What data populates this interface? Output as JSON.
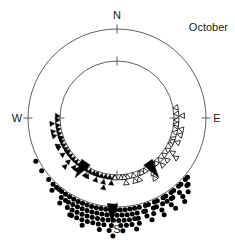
{
  "figure": {
    "title": "October",
    "type": "circular-orientation-diagram"
  },
  "axis_labels": {
    "north": "N",
    "east": "E",
    "south": "S",
    "west": "W"
  },
  "colors": {
    "stroke": "#4d4d4d",
    "marker_fill": "#000000",
    "marker_open_fill": "#ffffff",
    "text": "#1a1a1a",
    "background": "#ffffff"
  },
  "chart_data": {
    "type": "scatter",
    "title": "October",
    "xlabel": "",
    "ylabel": "",
    "coordinate_system": "polar-circular",
    "grid": false,
    "legend": "none",
    "axis_ticks": [
      {
        "label": "N",
        "angle_deg": 0
      },
      {
        "label": "E",
        "angle_deg": 90
      },
      {
        "label": "S",
        "angle_deg": 180
      },
      {
        "label": "W",
        "angle_deg": 270
      }
    ],
    "circles": [
      {
        "name": "outer-circle",
        "radius_px": 89
      },
      {
        "name": "inner-circle",
        "radius_px": 57
      }
    ],
    "center_px": {
      "x": 117,
      "y": 118
    },
    "series": [
      {
        "name": "outer-group-filled-circles",
        "marker": "filled-circle",
        "ring": "outer",
        "mean_vector_deg": 183,
        "values_deg": [
          242,
          235,
          228,
          224,
          221,
          219,
          217,
          215,
          214,
          212,
          211,
          210,
          209,
          208,
          207,
          206,
          205,
          204,
          203,
          202,
          201,
          200,
          199,
          198,
          197,
          196,
          195,
          194,
          193,
          192,
          191,
          190,
          189,
          188,
          187,
          186,
          185,
          184,
          183,
          182,
          181,
          180,
          179,
          178,
          177,
          176,
          175,
          174,
          173,
          172,
          171,
          170,
          169,
          168,
          166,
          164,
          162,
          160,
          158,
          156,
          154,
          152,
          150,
          148,
          146,
          144,
          142,
          140,
          138,
          136,
          134,
          132,
          130,
          205,
          199,
          193,
          187,
          183,
          178,
          172,
          168,
          163,
          159,
          154,
          149,
          145,
          140,
          136,
          222,
          214,
          206,
          198,
          190,
          184,
          177,
          170,
          163,
          156,
          148,
          141,
          133,
          202,
          196,
          189,
          182,
          175,
          168,
          161,
          154,
          147
        ],
        "stack_levels": [
          1,
          2,
          3,
          4
        ]
      },
      {
        "name": "inner-group-filled-triangles",
        "marker": "filled-triangle",
        "ring": "inner",
        "mean_vector_deg": 215,
        "values_deg": [
          272,
          268,
          263,
          259,
          255,
          251,
          247,
          243,
          239,
          235,
          231,
          227,
          223,
          219,
          215,
          211,
          207,
          203,
          199,
          195,
          191,
          187,
          183,
          265,
          258,
          250,
          243,
          236,
          228,
          221,
          214,
          207,
          199,
          192,
          185,
          254,
          245,
          236,
          227,
          218,
          209,
          200,
          191
        ],
        "stack_levels": [
          1,
          2,
          3
        ]
      },
      {
        "name": "inner-group-open-triangles",
        "marker": "open-triangle",
        "ring": "inner",
        "mean_vector_deg": 145,
        "values_deg": [
          80,
          86,
          92,
          98,
          104,
          110,
          116,
          122,
          128,
          134,
          140,
          146,
          152,
          158,
          164,
          170,
          176,
          182,
          88,
          96,
          105,
          113,
          122,
          130,
          139,
          147,
          156,
          164,
          173,
          100,
          112,
          124,
          136,
          148,
          160,
          172
        ],
        "stack_levels": [
          1,
          2,
          3
        ]
      }
    ],
    "arrows": [
      {
        "name": "mean-arrow-outer-south",
        "direction_deg": 183,
        "ring": "outer"
      },
      {
        "name": "mean-arrow-inner-southwest",
        "direction_deg": 215,
        "ring": "inner"
      },
      {
        "name": "mean-arrow-inner-southeast",
        "direction_deg": 145,
        "ring": "inner"
      }
    ]
  }
}
